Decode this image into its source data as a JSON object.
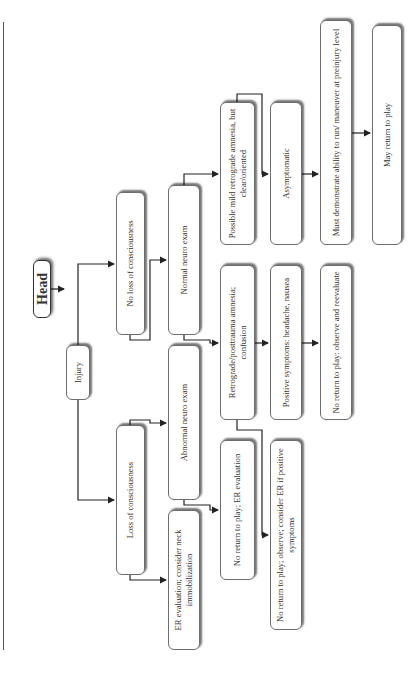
{
  "flowchart": {
    "title": "Head",
    "nodes": {
      "injury": "Injury",
      "no_loc": "No loss of consciousness",
      "loc": "Loss of consciousness",
      "normal_neuro": "Normal neuro exam",
      "abnormal_neuro": "Abnormal neuro exam",
      "er_eval": "ER evaluation; consider neck immobilization",
      "possible_mild": "Possible mild retrograde amnesia, but clear/oriented",
      "retrograde": "Retrograde/posttrauma amnesia; confusion",
      "no_return_er": "No return to play; ER evaluation",
      "asymptomatic": "Asymptomatic",
      "positive_symptoms": "Positive symptoms: headache, nausea",
      "no_return_observe_er": "No return to play; observe; consider ER if positive symptoms",
      "must_demonstrate": "Must demonstrate ability to run/ maneuver at preinjury level",
      "no_return_reevaluate": "No return to play: observe and reevaluate",
      "may_return": "May return to play"
    }
  }
}
